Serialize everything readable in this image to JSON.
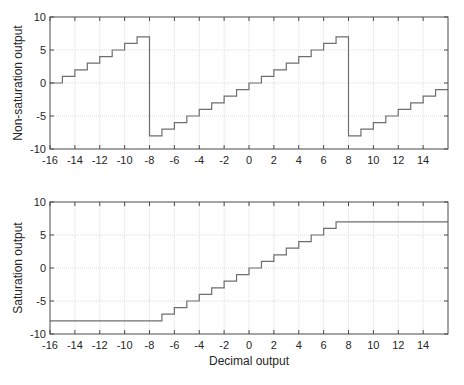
{
  "chart_data": [
    {
      "type": "line",
      "step": true,
      "title": "",
      "xlabel": "",
      "ylabel": "Non-saturation output",
      "xlim": [
        -16,
        16
      ],
      "ylim": [
        -10,
        10
      ],
      "xticks": [
        -16,
        -14,
        -12,
        -10,
        -8,
        -6,
        -4,
        -2,
        0,
        2,
        4,
        6,
        8,
        10,
        12,
        14
      ],
      "yticks": [
        -10,
        -5,
        0,
        5,
        10
      ],
      "grid": true,
      "series": [
        {
          "name": "Non-saturation output",
          "x": [
            -16,
            -15,
            -14,
            -13,
            -12,
            -11,
            -10,
            -9,
            -8,
            -7,
            -6,
            -5,
            -4,
            -3,
            -2,
            -1,
            0,
            1,
            2,
            3,
            4,
            5,
            6,
            7,
            8,
            9,
            10,
            11,
            12,
            13,
            14,
            15,
            16
          ],
          "values": [
            0,
            1,
            2,
            3,
            4,
            5,
            6,
            7,
            -8,
            -7,
            -6,
            -5,
            -4,
            -3,
            -2,
            -1,
            0,
            1,
            2,
            3,
            4,
            5,
            6,
            7,
            -8,
            -7,
            -6,
            -5,
            -4,
            -3,
            -2,
            -1,
            -1
          ]
        }
      ]
    },
    {
      "type": "line",
      "step": true,
      "title": "",
      "xlabel": "Decimal output",
      "ylabel": "Saturation output",
      "xlim": [
        -16,
        16
      ],
      "ylim": [
        -10,
        10
      ],
      "xticks": [
        -16,
        -14,
        -12,
        -10,
        -8,
        -6,
        -4,
        -2,
        0,
        2,
        4,
        6,
        8,
        10,
        12,
        14
      ],
      "yticks": [
        -10,
        -5,
        0,
        5,
        10
      ],
      "grid": true,
      "series": [
        {
          "name": "Saturation output",
          "x": [
            -16,
            -15,
            -14,
            -13,
            -12,
            -11,
            -10,
            -9,
            -8,
            -7,
            -6,
            -5,
            -4,
            -3,
            -2,
            -1,
            0,
            1,
            2,
            3,
            4,
            5,
            6,
            7,
            8,
            9,
            10,
            11,
            12,
            13,
            14,
            15,
            16
          ],
          "values": [
            -8,
            -8,
            -8,
            -8,
            -8,
            -8,
            -8,
            -8,
            -8,
            -7,
            -6,
            -5,
            -4,
            -3,
            -2,
            -1,
            0,
            1,
            2,
            3,
            4,
            5,
            6,
            7,
            7,
            7,
            7,
            7,
            7,
            7,
            7,
            7,
            7
          ]
        }
      ]
    }
  ],
  "style": {
    "line_color": "#6e6e6e",
    "axis_color": "#4a4a4a",
    "grid_color": "#dcdcdc"
  }
}
